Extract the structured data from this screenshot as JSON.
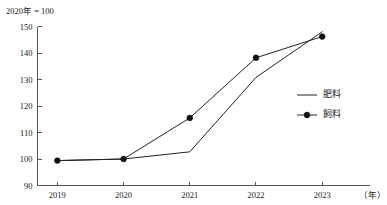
{
  "chart_data": {
    "type": "line",
    "title": "",
    "annotation": "2020年 = 100",
    "xlabel": "（年）",
    "ylabel": "",
    "categories": [
      "2019",
      "2020",
      "2021",
      "2022",
      "2023"
    ],
    "x": [
      2019,
      2020,
      2021,
      2022,
      2023
    ],
    "xlim": [
      2018.7,
      2023.45
    ],
    "ylim": [
      90,
      150
    ],
    "yticks": [
      90,
      100,
      110,
      120,
      130,
      140,
      150
    ],
    "ytick_labels": [
      "90",
      "100",
      "110",
      "120",
      "130",
      "140",
      "150"
    ],
    "xtick_labels": [
      "2019",
      "2020",
      "2021",
      "2022",
      "2023"
    ],
    "grid": false,
    "legend_position": "center-right",
    "series": [
      {
        "name": "肥料",
        "marker": "none",
        "color": "#222222",
        "values": [
          99.4,
          100.0,
          102.7,
          130.8,
          148.0
        ]
      },
      {
        "name": "飼料",
        "marker": "circle",
        "color": "#111111",
        "values": [
          99.4,
          100.0,
          115.5,
          138.2,
          146.2
        ]
      }
    ]
  },
  "legend": {
    "items": [
      {
        "label": "肥料"
      },
      {
        "label": "飼料"
      }
    ]
  }
}
